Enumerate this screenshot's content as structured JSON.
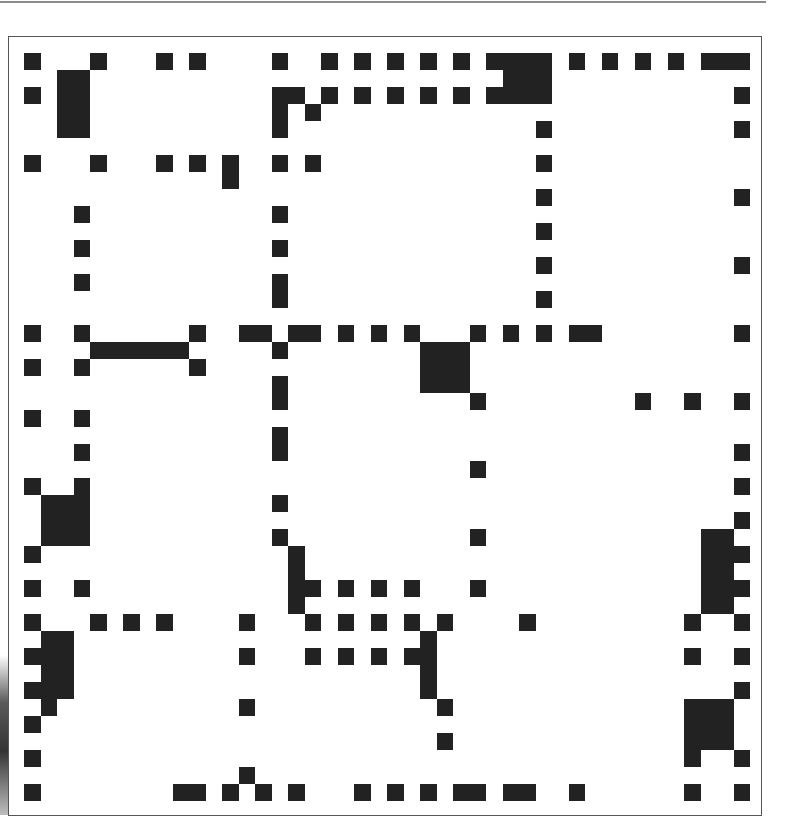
{
  "figure": {
    "rows": 44,
    "cols": 44,
    "fill_color": "#222222",
    "background_color": "#ffffff",
    "frame_color": "#555555",
    "grid": {
      "origin_x": 24.3,
      "origin_y": 52.7,
      "col_pitch": 16.5,
      "row_pitch": 17.0
    },
    "nonzeros_by_row": {
      "0": [
        0,
        4,
        8,
        10,
        15,
        18,
        20,
        22,
        24,
        26,
        28,
        29,
        30,
        31,
        33,
        35,
        37,
        39,
        41,
        42,
        43
      ],
      "1": [
        2,
        3,
        29,
        30,
        31
      ],
      "2": [
        0,
        2,
        3,
        15,
        16,
        18,
        20,
        22,
        24,
        26,
        28,
        29,
        30,
        31,
        43
      ],
      "3": [
        2,
        3,
        15,
        17
      ],
      "4": [
        2,
        3,
        15,
        31,
        43
      ],
      "5": [],
      "6": [
        0,
        4,
        8,
        10,
        12,
        15,
        17,
        31
      ],
      "7": [
        12
      ],
      "8": [
        31,
        43
      ],
      "9": [
        3,
        15
      ],
      "10": [
        31
      ],
      "11": [
        3,
        15
      ],
      "12": [
        31,
        43
      ],
      "13": [
        3,
        15
      ],
      "14": [
        15,
        31
      ],
      "15": [],
      "16": [
        0,
        3,
        10,
        13,
        14,
        16,
        17,
        19,
        21,
        23,
        27,
        29,
        31,
        33,
        34,
        43
      ],
      "17": [
        4,
        5,
        6,
        7,
        8,
        9,
        15,
        24,
        25,
        26
      ],
      "18": [
        0,
        3,
        10,
        24,
        25,
        26
      ],
      "19": [
        15,
        24,
        25,
        26
      ],
      "20": [
        15,
        27,
        37,
        40,
        43
      ],
      "21": [
        0,
        3
      ],
      "22": [
        15
      ],
      "23": [
        3,
        15,
        43
      ],
      "24": [
        27
      ],
      "25": [
        0,
        3,
        43
      ],
      "26": [
        1,
        2,
        3,
        15
      ],
      "27": [
        1,
        2,
        3,
        43
      ],
      "28": [
        1,
        2,
        3,
        15,
        27,
        41,
        42
      ],
      "29": [
        0,
        16,
        41,
        42,
        43
      ],
      "30": [
        16,
        41,
        42
      ],
      "31": [
        0,
        3,
        16,
        17,
        19,
        21,
        23,
        27,
        41,
        42,
        43
      ],
      "32": [
        16,
        41,
        42
      ],
      "33": [
        0,
        4,
        6,
        8,
        13,
        17,
        19,
        21,
        23,
        25,
        30,
        40,
        43
      ],
      "34": [
        1,
        2,
        24
      ],
      "35": [
        0,
        1,
        2,
        13,
        17,
        19,
        21,
        23,
        24,
        40,
        43
      ],
      "36": [
        1,
        2,
        24
      ],
      "37": [
        0,
        1,
        2,
        24,
        43
      ],
      "38": [
        1,
        13,
        25,
        40,
        41,
        42
      ],
      "39": [
        0,
        40,
        41,
        42
      ],
      "40": [
        25,
        40,
        41,
        42
      ],
      "41": [
        0,
        40,
        43
      ],
      "42": [
        13
      ],
      "43": [
        0,
        9,
        10,
        12,
        14,
        16,
        20,
        22,
        24,
        26,
        27,
        29,
        30,
        33,
        40,
        43
      ]
    }
  }
}
